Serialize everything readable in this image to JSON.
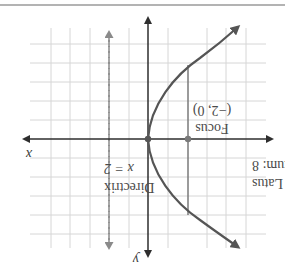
{
  "figure": {
    "orientation": "rotated-180",
    "colors": {
      "background": "#ffffff",
      "grid": "#d4d4d4",
      "axis": "#3a3a3a",
      "curve": "#555555",
      "directrix": "#8a8a8a",
      "latus_rectum": "#7a7a7a",
      "point": "#6a6a6a",
      "top_rule": "#9a9a9a",
      "text": "#4a4a4a"
    },
    "axes": {
      "x_label": "x",
      "y_label": "y"
    },
    "parabola": {
      "equation": "y^2 = -8x",
      "vertex": [
        0,
        0
      ],
      "opens": "left"
    },
    "focus": {
      "title": "Focus",
      "coords": "(−2, 0)"
    },
    "directrix": {
      "title": "Directrix",
      "equation": "x = 2"
    },
    "latus_rectum": {
      "line1": "Latus",
      "line2": "rectum: 8"
    }
  }
}
